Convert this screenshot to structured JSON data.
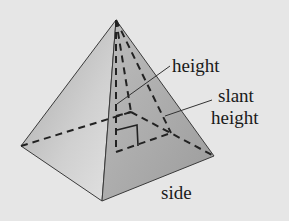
{
  "diagram": {
    "labels": {
      "height": "height",
      "slant_line1": "slant",
      "slant_line2": "height",
      "side": "side"
    },
    "colors": {
      "background": "#e6e6e6",
      "face_light": "#d4d4d4",
      "face_dark": "#a9a9a9",
      "line": "#2a2a2a"
    }
  }
}
